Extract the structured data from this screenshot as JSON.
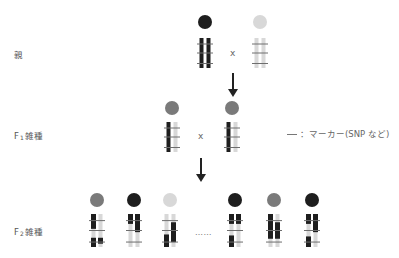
{
  "labels": {
    "parent": "親",
    "f1_prefix": "F",
    "f1_sub": "1",
    "f1_suffix": "雑種",
    "f2_prefix": "F",
    "f2_sub": "2",
    "f2_suffix": "雑種"
  },
  "cross_symbol": "x",
  "ellipsis": "……",
  "legend": {
    "text": "：マーカー(SNP など)"
  },
  "colors": {
    "black": "#1e1e1e",
    "gray": "#7a7a7a",
    "light": "#d8d8d8",
    "marker": "#6e6e6e"
  },
  "generations": {
    "parents": [
      {
        "circle": "black",
        "left": {
          "base": "black",
          "segs": []
        },
        "right": {
          "base": "black",
          "segs": []
        }
      },
      {
        "circle": "light",
        "left": {
          "base": "light",
          "segs": []
        },
        "right": {
          "base": "light",
          "segs": []
        }
      }
    ],
    "f1": [
      {
        "circle": "gray",
        "left": {
          "base": "black",
          "segs": []
        },
        "right": {
          "base": "light",
          "segs": []
        }
      },
      {
        "circle": "gray",
        "left": {
          "base": "black",
          "segs": []
        },
        "right": {
          "base": "light",
          "segs": []
        }
      }
    ],
    "f2": [
      {
        "circle": "gray",
        "left": {
          "base": "light",
          "segs": [
            [
              0.0,
              0.45
            ],
            [
              0.72,
              1.0
            ]
          ]
        },
        "right": {
          "base": "light",
          "segs": [
            [
              0.72,
              0.9
            ]
          ]
        }
      },
      {
        "circle": "black",
        "left": {
          "base": "light",
          "segs": [
            [
              0.0,
              0.3
            ]
          ]
        },
        "right": {
          "base": "light",
          "segs": [
            [
              0.0,
              0.55
            ]
          ]
        }
      },
      {
        "circle": "light",
        "left": {
          "base": "light",
          "segs": [
            [
              0.62,
              1.0
            ]
          ]
        },
        "right": {
          "base": "light",
          "segs": [
            [
              0.25,
              0.85
            ]
          ]
        }
      },
      {
        "circle": "black",
        "left": {
          "base": "light",
          "segs": [
            [
              0.0,
              0.3
            ],
            [
              0.65,
              1.0
            ]
          ]
        },
        "right": {
          "base": "light",
          "segs": [
            [
              0.0,
              0.3
            ]
          ]
        }
      },
      {
        "circle": "gray",
        "left": {
          "base": "light",
          "segs": [
            [
              0.0,
              0.75
            ]
          ]
        },
        "right": {
          "base": "light",
          "segs": [
            [
              0.25,
              0.75
            ]
          ]
        }
      },
      {
        "circle": "black",
        "left": {
          "base": "light",
          "segs": [
            [
              0.0,
              0.3
            ],
            [
              0.68,
              1.0
            ]
          ]
        },
        "right": {
          "base": "light",
          "segs": [
            [
              0.0,
              0.55
            ]
          ]
        }
      }
    ]
  }
}
